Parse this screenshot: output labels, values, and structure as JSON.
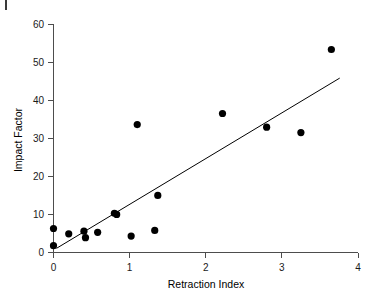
{
  "chart_data": {
    "type": "scatter",
    "title": "",
    "xlabel": "Retraction Index",
    "ylabel": "Impact Factor",
    "xlim": [
      0,
      4
    ],
    "ylim": [
      0,
      60
    ],
    "xticks": [
      0,
      1,
      2,
      3,
      4
    ],
    "yticks": [
      0,
      10,
      20,
      30,
      40,
      50,
      60
    ],
    "xtick_labels": [
      "0",
      "1",
      "2",
      "3",
      "4"
    ],
    "ytick_labels": [
      "0",
      "10",
      "20",
      "30",
      "40",
      "50",
      "60"
    ],
    "grid": false,
    "legend": false,
    "marker": "filled-circle",
    "marker_color": "#000000",
    "points": [
      {
        "x": 0.0,
        "y": 6.3
      },
      {
        "x": 0.0,
        "y": 1.8
      },
      {
        "x": 0.2,
        "y": 4.9
      },
      {
        "x": 0.4,
        "y": 5.6
      },
      {
        "x": 0.42,
        "y": 3.9
      },
      {
        "x": 0.58,
        "y": 5.3
      },
      {
        "x": 0.8,
        "y": 10.3
      },
      {
        "x": 0.83,
        "y": 10.0
      },
      {
        "x": 1.02,
        "y": 4.3
      },
      {
        "x": 1.1,
        "y": 33.6
      },
      {
        "x": 1.33,
        "y": 5.8
      },
      {
        "x": 1.37,
        "y": 15.0
      },
      {
        "x": 2.22,
        "y": 36.5
      },
      {
        "x": 2.8,
        "y": 32.9
      },
      {
        "x": 3.25,
        "y": 31.5
      },
      {
        "x": 3.65,
        "y": 53.3
      }
    ],
    "trend_line": {
      "label": "linear fit",
      "x0": 0.04,
      "y0": 1.1,
      "x1": 3.76,
      "y1": 45.8,
      "color": "#000000"
    },
    "annotations": [
      {
        "name": "corner-mark",
        "text": ""
      }
    ]
  }
}
